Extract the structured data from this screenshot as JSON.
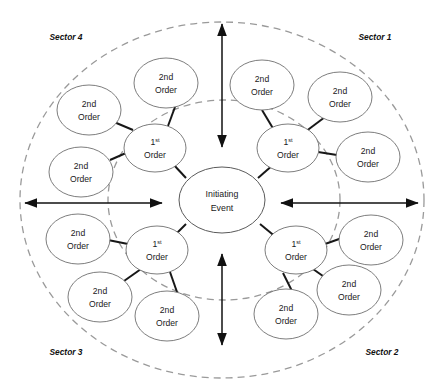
{
  "diagram": {
    "center": {
      "line1": "Initiating",
      "line2": "Event"
    },
    "first_order": {
      "num": "1",
      "sup": "st",
      "line2": "Order"
    },
    "second_order": {
      "line1": "2nd",
      "line2": "Order"
    },
    "sectors": [
      {
        "id": "sector-1",
        "label": "Sector 1"
      },
      {
        "id": "sector-2",
        "label": "Sector 2"
      },
      {
        "id": "sector-3",
        "label": "Sector 3"
      },
      {
        "id": "sector-4",
        "label": "Sector 4"
      }
    ],
    "colors": {
      "node_stroke": "#6e6e6e",
      "boundary_stroke": "#9a9a9a",
      "connector_stroke": "#171717",
      "arrow_stroke": "#111111",
      "text": "#1a1a1a",
      "background": "#ffffff"
    },
    "nodes": {
      "center": {
        "cx": 222,
        "cy": 200,
        "rx": 43,
        "ry": 33
      },
      "first_order_nodes": [
        {
          "id": "first-order-sector-1",
          "cx": 288,
          "cy": 148,
          "rx": 31,
          "ry": 24
        },
        {
          "id": "first-order-sector-2",
          "cx": 296,
          "cy": 250,
          "rx": 31,
          "ry": 24
        },
        {
          "id": "first-order-sector-3",
          "cx": 157,
          "cy": 250,
          "rx": 31,
          "ry": 24
        },
        {
          "id": "first-order-sector-4",
          "cx": 155,
          "cy": 148,
          "rx": 31,
          "ry": 24
        }
      ],
      "second_order_nodes": [
        {
          "id": "second-order-s1-a",
          "cx": 262,
          "cy": 85,
          "rx": 32,
          "ry": 25
        },
        {
          "id": "second-order-s1-b",
          "cx": 340,
          "cy": 97,
          "rx": 32,
          "ry": 25
        },
        {
          "id": "second-order-s1-c",
          "cx": 368,
          "cy": 157,
          "rx": 32,
          "ry": 25
        },
        {
          "id": "second-order-s2-a",
          "cx": 371,
          "cy": 240,
          "rx": 32,
          "ry": 25
        },
        {
          "id": "second-order-s2-b",
          "cx": 349,
          "cy": 290,
          "rx": 32,
          "ry": 25
        },
        {
          "id": "second-order-s2-c",
          "cx": 286,
          "cy": 314,
          "rx": 32,
          "ry": 25
        },
        {
          "id": "second-order-s3-a",
          "cx": 167,
          "cy": 316,
          "rx": 32,
          "ry": 25
        },
        {
          "id": "second-order-s3-b",
          "cx": 100,
          "cy": 297,
          "rx": 32,
          "ry": 25
        },
        {
          "id": "second-order-s3-c",
          "cx": 78,
          "cy": 239,
          "rx": 32,
          "ry": 25
        },
        {
          "id": "second-order-s4-a",
          "cx": 81,
          "cy": 172,
          "rx": 32,
          "ry": 25
        },
        {
          "id": "second-order-s4-b",
          "cx": 89,
          "cy": 110,
          "rx": 32,
          "ry": 25
        },
        {
          "id": "second-order-s4-c",
          "cx": 166,
          "cy": 83,
          "rx": 32,
          "ry": 25
        }
      ]
    },
    "boundaries": [
      {
        "id": "outer-boundary",
        "cx": 222,
        "cy": 200,
        "rx": 202,
        "ry": 178
      },
      {
        "id": "inner-boundary",
        "cx": 224,
        "cy": 200,
        "rx": 116,
        "ry": 100
      }
    ],
    "axes": [
      {
        "id": "axis-arrow-top",
        "x1": 222,
        "y1": 20,
        "x2": 222,
        "y2": 151
      },
      {
        "id": "axis-arrow-bottom",
        "x1": 222,
        "y1": 349,
        "x2": 222,
        "y2": 250
      },
      {
        "id": "axis-arrow-left",
        "x1": 21,
        "y1": 203,
        "x2": 166,
        "y2": 203
      },
      {
        "id": "axis-arrow-right",
        "x1": 422,
        "y1": 203,
        "x2": 277,
        "y2": 203
      }
    ],
    "sector_label_positions": [
      {
        "id": "sector-1",
        "x": 375,
        "y": 40
      },
      {
        "id": "sector-2",
        "x": 382,
        "y": 355
      },
      {
        "id": "sector-3",
        "x": 66,
        "y": 355
      },
      {
        "id": "sector-4",
        "x": 66,
        "y": 40
      }
    ]
  }
}
